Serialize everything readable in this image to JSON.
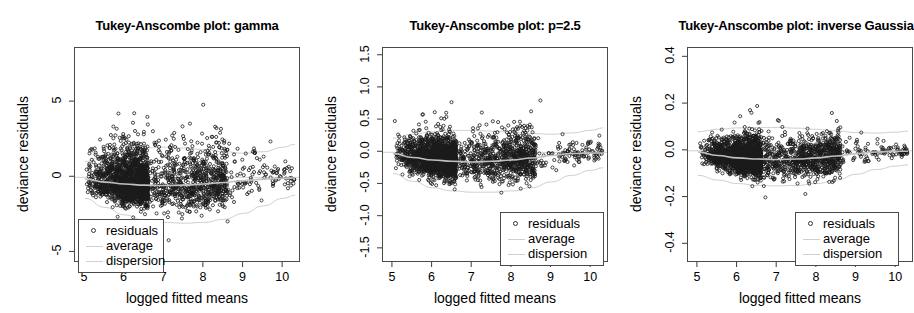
{
  "figure": {
    "width": 914,
    "height": 313,
    "background": "#ffffff",
    "point_color": "#1a1a1a",
    "average_color": "#bfbfbf",
    "dispersion_color": "#cfcfcf",
    "axis_color": "#4a4a4a"
  },
  "legend": {
    "items": [
      {
        "label": "residuals",
        "key": "circle-marker"
      },
      {
        "label": "average",
        "key": "line-marker"
      },
      {
        "label": "dispersion",
        "key": "line-marker"
      }
    ]
  },
  "chart_data": [
    {
      "type": "scatter",
      "title": "Tukey-Anscombe plot: gamma",
      "xlabel": "logged fitted means",
      "ylabel": "deviance residuals",
      "xlim": [
        4.75,
        10.45
      ],
      "ylim": [
        -5.7,
        8.6
      ],
      "xticks": [
        5,
        6,
        7,
        8,
        9,
        10
      ],
      "xtick_labels": [
        "5",
        "6",
        "7",
        "8",
        "9",
        "10"
      ],
      "yticks": [
        -5,
        0,
        5
      ],
      "ytick_labels": [
        "-5",
        "0",
        "5"
      ],
      "grid": false,
      "legend_position": "bottom-left",
      "n_points": 2600,
      "seed": 17,
      "cloud": {
        "x_mode": 6.6,
        "x_min": 5.02,
        "x_max": 10.3,
        "center_offset": -0.55,
        "spread_base": 0.95,
        "spread_tail": 0.45,
        "skew_up": 1.9,
        "outlier_frac": 0.035,
        "outlier_scale": 3.2
      },
      "average_curve": [
        [
          5.0,
          -0.12
        ],
        [
          5.5,
          -0.32
        ],
        [
          6.0,
          -0.45
        ],
        [
          6.5,
          -0.52
        ],
        [
          7.0,
          -0.55
        ],
        [
          7.5,
          -0.52
        ],
        [
          8.0,
          -0.45
        ],
        [
          8.5,
          -0.35
        ],
        [
          9.0,
          -0.22
        ],
        [
          9.5,
          -0.12
        ],
        [
          10.0,
          -0.06
        ],
        [
          10.3,
          -0.05
        ]
      ],
      "dispersion_upper": [
        [
          5.0,
          1.05
        ],
        [
          5.5,
          1.45
        ],
        [
          6.0,
          1.75
        ],
        [
          6.5,
          1.95
        ],
        [
          7.0,
          2.0
        ],
        [
          7.5,
          1.95
        ],
        [
          8.0,
          1.85
        ],
        [
          8.5,
          1.7
        ],
        [
          9.0,
          1.6
        ],
        [
          9.5,
          1.7
        ],
        [
          10.0,
          2.0
        ],
        [
          10.3,
          2.2
        ]
      ],
      "dispersion_lower": [
        [
          5.0,
          -1.4
        ],
        [
          5.5,
          -2.0
        ],
        [
          6.0,
          -2.5
        ],
        [
          6.5,
          -2.85
        ],
        [
          7.0,
          -3.0
        ],
        [
          7.5,
          -3.05
        ],
        [
          8.0,
          -3.0
        ],
        [
          8.5,
          -2.8
        ],
        [
          9.0,
          -2.4
        ],
        [
          9.5,
          -1.9
        ],
        [
          10.0,
          -1.4
        ],
        [
          10.3,
          -1.2
        ]
      ],
      "zero_line": 0
    },
    {
      "type": "scatter",
      "title": "Tukey-Anscombe plot: p=2.5",
      "xlabel": "logged fitted means",
      "ylabel": "deviance residuals",
      "xlim": [
        4.75,
        10.45
      ],
      "ylim": [
        -1.72,
        1.62
      ],
      "xticks": [
        5,
        6,
        7,
        8,
        9,
        10
      ],
      "xtick_labels": [
        "5",
        "6",
        "7",
        "8",
        "9",
        "10"
      ],
      "yticks": [
        -1.5,
        -1.0,
        -0.5,
        0.0,
        0.5,
        1.0,
        1.5
      ],
      "ytick_labels": [
        "-1.5",
        "-1.0",
        "-0.5",
        "0.0",
        "0.5",
        "1.0",
        "1.5"
      ],
      "grid": false,
      "legend_position": "bottom-right",
      "n_points": 2600,
      "seed": 43,
      "cloud": {
        "x_mode": 6.6,
        "x_min": 5.02,
        "x_max": 10.3,
        "center_offset": -0.12,
        "spread_base": 0.2,
        "spread_tail": 0.1,
        "skew_up": 1.35,
        "outlier_frac": 0.03,
        "outlier_scale": 2.9
      },
      "average_curve": [
        [
          5.0,
          -0.02
        ],
        [
          5.5,
          -0.08
        ],
        [
          6.0,
          -0.12
        ],
        [
          6.5,
          -0.14
        ],
        [
          7.0,
          -0.15
        ],
        [
          7.5,
          -0.14
        ],
        [
          8.0,
          -0.12
        ],
        [
          8.5,
          -0.09
        ],
        [
          9.0,
          -0.05
        ],
        [
          9.5,
          -0.02
        ],
        [
          10.0,
          -0.01
        ],
        [
          10.3,
          -0.01
        ]
      ],
      "dispersion_upper": [
        [
          5.0,
          0.22
        ],
        [
          5.5,
          0.28
        ],
        [
          6.0,
          0.32
        ],
        [
          6.5,
          0.34
        ],
        [
          7.0,
          0.34
        ],
        [
          7.5,
          0.33
        ],
        [
          8.0,
          0.31
        ],
        [
          8.5,
          0.29
        ],
        [
          9.0,
          0.28
        ],
        [
          9.5,
          0.3
        ],
        [
          10.0,
          0.34
        ],
        [
          10.3,
          0.38
        ]
      ],
      "dispersion_lower": [
        [
          5.0,
          -0.33
        ],
        [
          5.5,
          -0.45
        ],
        [
          6.0,
          -0.55
        ],
        [
          6.5,
          -0.6
        ],
        [
          7.0,
          -0.62
        ],
        [
          7.5,
          -0.62
        ],
        [
          8.0,
          -0.6
        ],
        [
          8.5,
          -0.55
        ],
        [
          9.0,
          -0.46
        ],
        [
          9.5,
          -0.36
        ],
        [
          10.0,
          -0.28
        ],
        [
          10.3,
          -0.24
        ]
      ],
      "zero_line": 0
    },
    {
      "type": "scatter",
      "title": "Tukey-Anscombe plot: inverse Gaussian",
      "xlabel": "logged fitted means",
      "ylabel": "deviance residuals",
      "xlim": [
        4.75,
        10.45
      ],
      "ylim": [
        -0.48,
        0.44
      ],
      "xticks": [
        5,
        6,
        7,
        8,
        9,
        10
      ],
      "xtick_labels": [
        "5",
        "6",
        "7",
        "8",
        "9",
        "10"
      ],
      "yticks": [
        -0.4,
        -0.2,
        0.0,
        0.2,
        0.4
      ],
      "ytick_labels": [
        "-0.4",
        "-0.2",
        "0.0",
        "0.2",
        "0.4"
      ],
      "grid": false,
      "legend_position": "bottom-right",
      "n_points": 2600,
      "seed": 91,
      "cloud": {
        "x_mode": 6.6,
        "x_min": 5.02,
        "x_max": 10.3,
        "center_offset": -0.03,
        "spread_base": 0.05,
        "spread_tail": 0.016,
        "skew_up": 1.25,
        "outlier_frac": 0.025,
        "outlier_scale": 2.6
      },
      "average_curve": [
        [
          5.0,
          -0.005
        ],
        [
          5.5,
          -0.02
        ],
        [
          6.0,
          -0.03
        ],
        [
          6.5,
          -0.035
        ],
        [
          7.0,
          -0.037
        ],
        [
          7.5,
          -0.035
        ],
        [
          8.0,
          -0.03
        ],
        [
          8.5,
          -0.022
        ],
        [
          9.0,
          -0.012
        ],
        [
          9.5,
          -0.005
        ],
        [
          10.0,
          -0.002
        ],
        [
          10.3,
          -0.002
        ]
      ],
      "dispersion_upper": [
        [
          5.0,
          0.082
        ],
        [
          5.5,
          0.092
        ],
        [
          6.0,
          0.098
        ],
        [
          6.5,
          0.1
        ],
        [
          7.0,
          0.1
        ],
        [
          7.5,
          0.097
        ],
        [
          8.0,
          0.092
        ],
        [
          8.5,
          0.085
        ],
        [
          9.0,
          0.078
        ],
        [
          9.5,
          0.076
        ],
        [
          10.0,
          0.08
        ],
        [
          10.3,
          0.084
        ]
      ],
      "dispersion_lower": [
        [
          5.0,
          -0.105
        ],
        [
          5.5,
          -0.125
        ],
        [
          6.0,
          -0.14
        ],
        [
          6.5,
          -0.148
        ],
        [
          7.0,
          -0.15
        ],
        [
          7.5,
          -0.148
        ],
        [
          8.0,
          -0.14
        ],
        [
          8.5,
          -0.125
        ],
        [
          9.0,
          -0.1
        ],
        [
          9.5,
          -0.08
        ],
        [
          10.0,
          -0.065
        ],
        [
          10.3,
          -0.06
        ]
      ],
      "zero_line": 0
    }
  ],
  "panel_geometry": [
    {
      "box_left": 74,
      "box_top": 47,
      "box_width": 226,
      "box_height": 215,
      "legend_left": 78,
      "legend_top": 219,
      "legend_width": 86
    },
    {
      "box_left": 382,
      "box_top": 47,
      "box_width": 226,
      "box_height": 215,
      "legend_left": 500,
      "legend_top": 212,
      "legend_width": 104
    },
    {
      "box_left": 687,
      "box_top": 47,
      "box_width": 226,
      "box_height": 215,
      "legend_left": 795,
      "legend_top": 212,
      "legend_width": 104
    }
  ]
}
